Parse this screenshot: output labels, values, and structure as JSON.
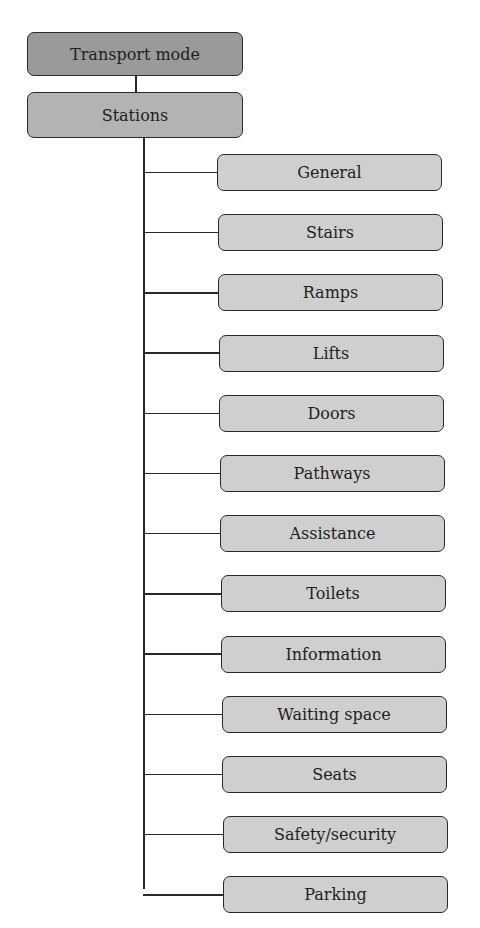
{
  "diagram": {
    "type": "tree",
    "root": {
      "label": "Transport mode"
    },
    "level1": {
      "label": "Stations"
    },
    "children": [
      {
        "label": "General"
      },
      {
        "label": "Stairs"
      },
      {
        "label": "Ramps"
      },
      {
        "label": "Lifts"
      },
      {
        "label": "Doors"
      },
      {
        "label": "Pathways"
      },
      {
        "label": "Assistance"
      },
      {
        "label": "Toilets"
      },
      {
        "label": "Information"
      },
      {
        "label": "Waiting space"
      },
      {
        "label": "Seats"
      },
      {
        "label": "Safety/security"
      },
      {
        "label": "Parking"
      }
    ],
    "colors": {
      "root_fill": "#9a9a9a",
      "level1_fill": "#b3b3b3",
      "child_fill": "#cfcfcf",
      "stroke": "#2a2a2a"
    }
  }
}
